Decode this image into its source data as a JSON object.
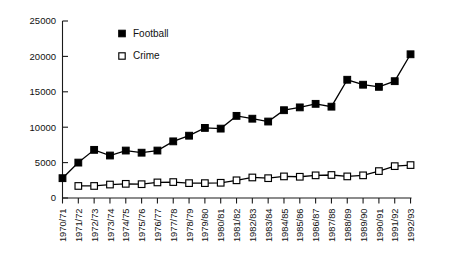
{
  "chart_data": {
    "type": "line",
    "title": "",
    "subtitle": "",
    "xlabel": "",
    "ylabel": "",
    "ylim": [
      0,
      25000
    ],
    "ytick_labels": [
      "0",
      "5000",
      "10000",
      "15000",
      "20000",
      "25000"
    ],
    "ytick_values": [
      0,
      5000,
      10000,
      15000,
      20000,
      25000
    ],
    "grid": false,
    "legend_position": "upper-left-inside",
    "categories": [
      "1970/71",
      "1971/72",
      "1972/73",
      "1973/74",
      "1974/75",
      "1975/76",
      "1976/77",
      "1977/78",
      "1978/79",
      "1979/80",
      "1980/81",
      "1981/82",
      "1982/83",
      "1983/84",
      "1984/85",
      "1985/86",
      "1986/87",
      "1987/88",
      "1988/89",
      "1989/90",
      "1990/91",
      "1991/92",
      "1992/93"
    ],
    "series": [
      {
        "name": "Football",
        "marker": "filled-square",
        "values": [
          2800,
          5000,
          6800,
          6000,
          6700,
          6400,
          6700,
          8000,
          8800,
          9900,
          9800,
          11600,
          11200,
          10800,
          12400,
          12800,
          13300,
          12900,
          16700,
          16000,
          15700,
          16500,
          20300
        ]
      },
      {
        "name": "Crime",
        "marker": "open-square",
        "values": [
          null,
          1700,
          1700,
          1900,
          2000,
          1950,
          2200,
          2250,
          2100,
          2100,
          2150,
          2500,
          2900,
          2800,
          3050,
          3000,
          3200,
          3250,
          3050,
          3200,
          3800,
          4500,
          4650
        ]
      }
    ]
  },
  "legend": {
    "entries": [
      {
        "label": "Football",
        "marker": "filled-square"
      },
      {
        "label": "Crime",
        "marker": "open-square"
      }
    ]
  },
  "colors": {
    "series_stroke": "#000000",
    "filled_marker": "#000000",
    "open_marker_fill": "#ffffff",
    "axis": "#1a1a1a",
    "text": "#111111",
    "background": "#ffffff"
  }
}
